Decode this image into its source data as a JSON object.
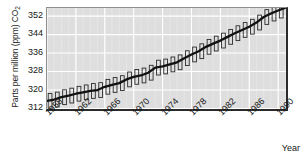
{
  "chart_data": {
    "type": "line",
    "title": "",
    "subtitle": "",
    "xlabel": "Year",
    "ylabel": "Parts per million (ppm) CO2",
    "ylabel_text": "Parts per million (ppm) CO",
    "ylabel_sub": "2",
    "xlim": [
      1958,
      1991.5
    ],
    "ylim": [
      310.5,
      355.5
    ],
    "yticks": [
      312,
      320,
      328,
      336,
      344,
      352
    ],
    "ytick_labels": [
      "312",
      "320",
      "328",
      "336",
      "344",
      "352"
    ],
    "xticks": [
      1958,
      1962,
      1966,
      1970,
      1974,
      1978,
      1982,
      1986,
      1990
    ],
    "xtick_labels": [
      "1958",
      "1962",
      "1966",
      "1970",
      "1974",
      "1978",
      "1982",
      "1986",
      "1990"
    ],
    "grid": true,
    "grid_color": "#ffffff",
    "minor_grid": true,
    "plot_background": "#dedede",
    "legend": null,
    "legend_position": "none",
    "series": [
      {
        "name": "Annual mean CO2 trend",
        "style": "line",
        "color": "#111111",
        "x": [
          1958,
          1959,
          1960,
          1961,
          1962,
          1963,
          1964,
          1965,
          1966,
          1967,
          1968,
          1969,
          1970,
          1971,
          1972,
          1973,
          1974,
          1975,
          1976,
          1977,
          1978,
          1979,
          1980,
          1981,
          1982,
          1983,
          1984,
          1985,
          1986,
          1987,
          1988,
          1989,
          1990,
          1991
        ],
        "values": [
          315.3,
          315.9,
          316.9,
          317.6,
          318.4,
          319.0,
          319.6,
          320.0,
          321.4,
          322.2,
          323.0,
          324.6,
          325.7,
          326.3,
          327.5,
          329.7,
          330.2,
          331.1,
          332.0,
          333.8,
          335.4,
          336.8,
          338.7,
          340.1,
          341.4,
          343.0,
          344.6,
          346.0,
          347.4,
          349.2,
          351.6,
          353.1,
          354.4,
          355.6
        ]
      },
      {
        "name": "Monthly seasonal oscillation",
        "style": "sawtooth-outline",
        "color": "#2b2b2b",
        "amplitude_ppm": 3.2,
        "note": "Hollow vertical bars spanning seasonal min-to-max about the trend, one per year"
      }
    ],
    "annotations": []
  }
}
